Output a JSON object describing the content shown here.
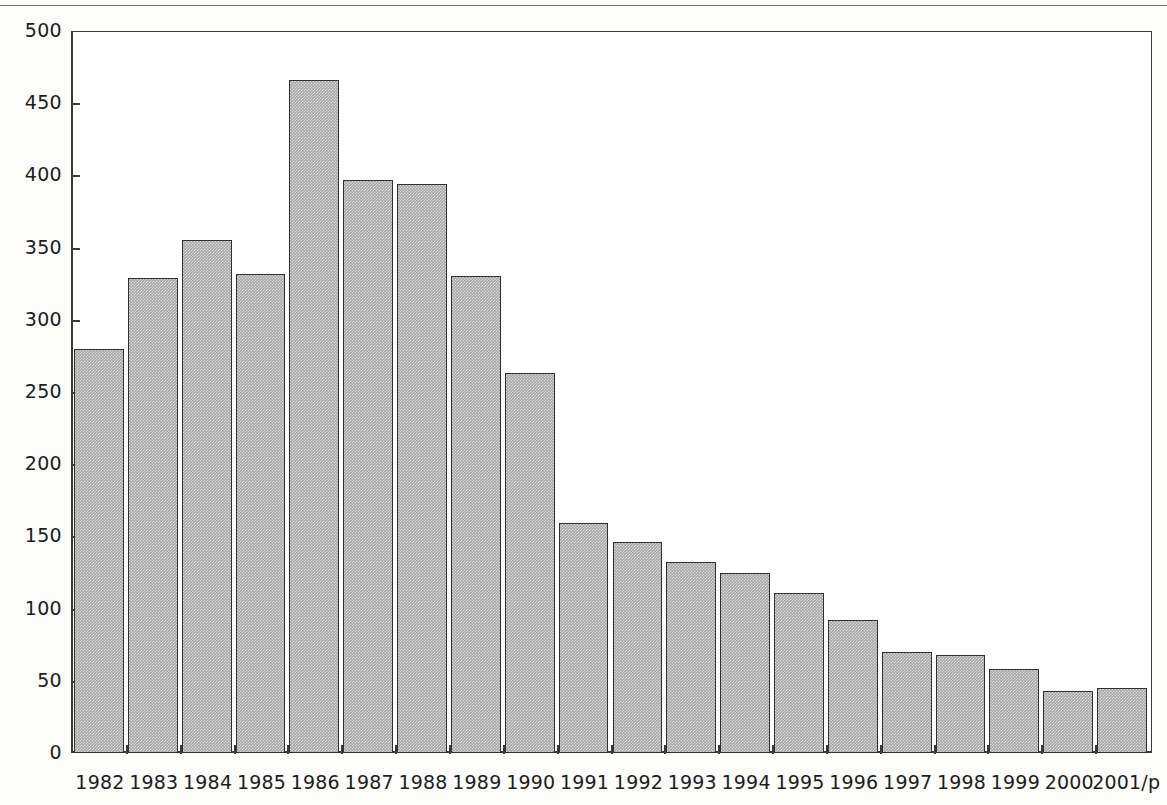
{
  "chart_data": {
    "type": "bar",
    "title": "",
    "subtitle": "",
    "xlabel": "",
    "ylabel": "",
    "ylim": [
      0,
      500
    ],
    "ytick_step": 50,
    "grid": false,
    "legend": null,
    "bar_color": "#a6a6a6",
    "bar_border_color": "#2f2f2f",
    "axis_color": "#3a3a3a",
    "categories": [
      "1982",
      "1983",
      "1984",
      "1985",
      "1986",
      "1987",
      "1988",
      "1989",
      "1990",
      "1991",
      "1992",
      "1993",
      "1994",
      "1995",
      "1996",
      "1997",
      "1998",
      "1999",
      "2000",
      "2001/p"
    ],
    "values": [
      280,
      329,
      355,
      332,
      466,
      397,
      394,
      330,
      263,
      159,
      146,
      132,
      125,
      111,
      92,
      70,
      68,
      58,
      43,
      45
    ],
    "ytick_labels": [
      "500",
      "450",
      "400",
      "350",
      "300",
      "250",
      "200",
      "150",
      "100",
      "50",
      "0"
    ],
    "ytick_values": [
      500,
      450,
      400,
      350,
      300,
      250,
      200,
      150,
      100,
      50,
      0
    ]
  }
}
